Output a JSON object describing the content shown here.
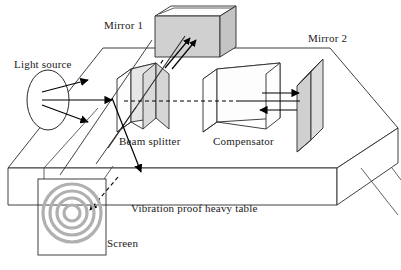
{
  "figure": {
    "background_color": "#ffffff",
    "line_color": "#2b2b2b",
    "ray_color": "#000000",
    "shade_color": "#d0d0d0",
    "ring_color": "#b0b0b0"
  },
  "labels": {
    "light_source": "Light source",
    "mirror1": "Mirror 1",
    "mirror2": "Mirror 2",
    "beam_splitter": "Beam splitter",
    "compensator": "Compensator",
    "table": "Vibration proof heavy table",
    "screen": "Screen"
  },
  "components": [
    {
      "name": "light-source",
      "label": "Light source",
      "shape": "ellipse",
      "shaded": false
    },
    {
      "name": "beam-splitter",
      "label": "Beam splitter",
      "shape": "tilted-plate",
      "shaded": true
    },
    {
      "name": "compensator",
      "label": "Compensator",
      "shape": "tilted-plate",
      "shaded": false
    },
    {
      "name": "mirror-1",
      "label": "Mirror 1",
      "shape": "block",
      "shaded": true
    },
    {
      "name": "mirror-2",
      "label": "Mirror 2",
      "shape": "plate",
      "shaded": true
    },
    {
      "name": "screen",
      "label": "Screen",
      "shape": "square",
      "shaded": false
    },
    {
      "name": "optical-table",
      "label": "Vibration proof heavy table",
      "shape": "slab",
      "shaded": false
    }
  ],
  "beams": [
    {
      "name": "source-to-splitter",
      "style": "solid",
      "arrows": 3
    },
    {
      "name": "splitter-to-compensator-to-mirror2",
      "style": "dashed-and-solid",
      "arrows": 2
    },
    {
      "name": "splitter-to-mirror1",
      "style": "solid",
      "arrows": 2
    },
    {
      "name": "splitter-to-screen",
      "style": "dashed",
      "arrows": 2
    }
  ],
  "screen_pattern": {
    "name": "circular-fringes",
    "ring_count": 4,
    "radii": [
      8,
      15,
      22,
      29
    ]
  }
}
